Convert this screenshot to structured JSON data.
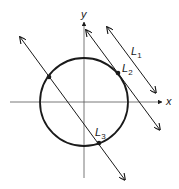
{
  "diagram": {
    "axes": {
      "x_label": "x",
      "y_label": "y"
    },
    "circle": {
      "cx": 84,
      "cy": 102,
      "r": 44
    },
    "lines": [
      {
        "name": "L",
        "sub": "1",
        "relation": "does not intersect circle"
      },
      {
        "name": "L",
        "sub": "2",
        "relation": "tangent to circle"
      },
      {
        "name": "L",
        "sub": "3",
        "relation": "intersects circle at two points"
      }
    ],
    "colors": {
      "stroke": "#1a1a1a",
      "axis": "#555555",
      "background": "#ffffff"
    }
  }
}
